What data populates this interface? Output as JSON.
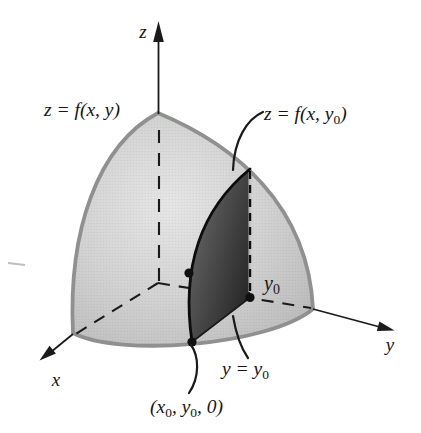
{
  "figure": {
    "labels": {
      "axis_z": "z",
      "axis_x": "x",
      "axis_y": "y",
      "surface_eq": "z = f(x, y)",
      "section_eq_main": "z = f(x, y",
      "section_eq_sub": "0",
      "section_eq_end": ")",
      "y0_main": "y",
      "y0_sub": "0",
      "plane_main": "y = y",
      "plane_sub": "0",
      "pt_p1": "(x",
      "pt_s1": "0",
      "pt_p2": ", y",
      "pt_s2": "0",
      "pt_p3": ", 0)"
    },
    "colors": {
      "background": "#ffffff",
      "dome_light": "#e6e6e6",
      "dome_mid": "#d2d2d2",
      "dome_shade": "#c0c0c0",
      "dome_dark": "#b4b4b4",
      "dome_edge": "#8e918e",
      "section_light": "#6e6e6e",
      "section_dark": "#242424",
      "ink": "#1a1a1a",
      "surface_label_gray": "#9aa09d"
    }
  }
}
